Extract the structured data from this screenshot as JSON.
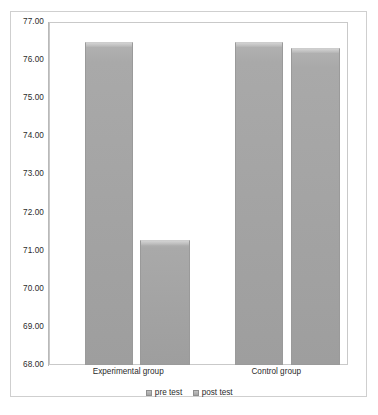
{
  "chart_data": {
    "type": "bar",
    "title": "",
    "subtitle": "",
    "xlabel": "",
    "ylabel": "",
    "categories": [
      "Experimental group",
      "Control group"
    ],
    "series": [
      {
        "name": "pre test",
        "values": [
          76.5,
          76.5
        ]
      },
      {
        "name": "post test",
        "values": [
          71.3,
          76.35
        ]
      }
    ],
    "ylim": [
      68.0,
      77.0
    ],
    "ytick_labels": [
      "77.00",
      "76.00",
      "75.00",
      "74.00",
      "73.00",
      "72.00",
      "71.00",
      "70.00",
      "69.00",
      "68.00"
    ],
    "ytick_values": [
      77.0,
      76.0,
      75.0,
      74.0,
      73.0,
      72.0,
      71.0,
      70.0,
      69.0,
      68.0
    ],
    "grid": false,
    "legend_position": "bottom",
    "legend_entries": [
      "pre test",
      "post test"
    ],
    "colors": {
      "bar_fill": "#a5a5a5",
      "bar_border": "#9a9a9a",
      "plot_border": "#c9c9c9",
      "chart_border": "#cfcfcf",
      "text": "#2b2b2b",
      "background": "#ffffff"
    },
    "bar_geometry": [
      {
        "category_index": 0,
        "series_index": 0,
        "left_pct": 11.7,
        "width_pct": 16.4
      },
      {
        "category_index": 0,
        "series_index": 1,
        "left_pct": 30.4,
        "width_pct": 16.7
      },
      {
        "category_index": 1,
        "series_index": 0,
        "left_pct": 62.2,
        "width_pct": 16.4
      },
      {
        "category_index": 1,
        "series_index": 1,
        "left_pct": 81.3,
        "width_pct": 16.4
      }
    ],
    "category_label_positions_pct": [
      26.5,
      76.0
    ]
  }
}
